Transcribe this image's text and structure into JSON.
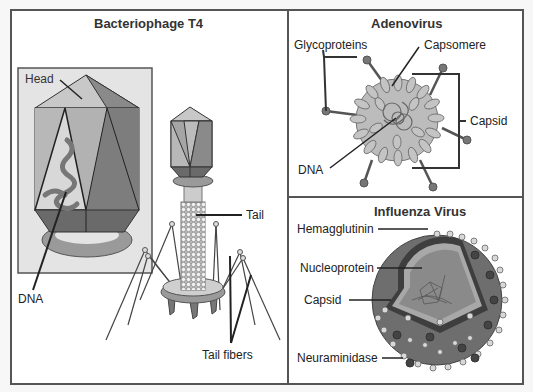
{
  "panels": {
    "phage": {
      "title": "Bacteriophage T4",
      "labels": {
        "head": "Head",
        "dna": "DNA",
        "tail": "Tail",
        "tail_fibers": "Tail fibers"
      }
    },
    "adenovirus": {
      "title": "Adenovirus",
      "labels": {
        "glycoproteins": "Glycoproteins",
        "capsomere": "Capsomere",
        "capsid": "Capsid",
        "dna": "DNA"
      }
    },
    "influenza": {
      "title": "Influenza Virus",
      "labels": {
        "hemagglutinin": "Hemagglutinin",
        "nucleoprotein": "Nucleoprotein",
        "capsid": "Capsid",
        "neuraminidase": "Neuraminidase"
      }
    }
  },
  "colors": {
    "border": "#555555",
    "dark": "#6a6a6a",
    "mid": "#9a9a9a",
    "light": "#c8c8c8",
    "inset_bg": "#e4e4e4"
  }
}
